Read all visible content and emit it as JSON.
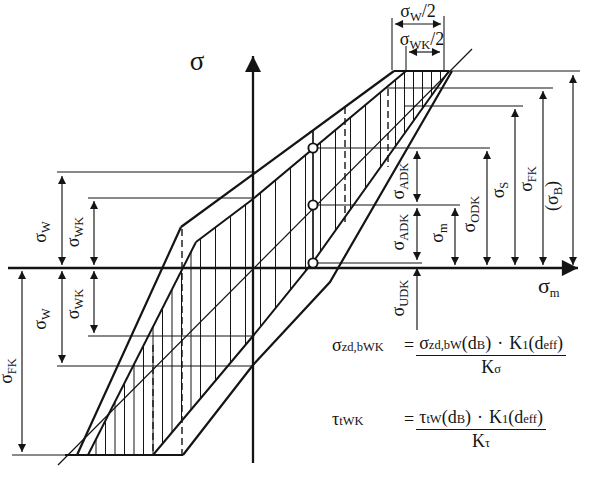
{
  "axes": {
    "vertical": "σ",
    "horizontal_main": "σ",
    "horizontal_sub": "m"
  },
  "dims": {
    "sw_half": {
      "m": "σ",
      "s": "W",
      "x": "/2"
    },
    "swk_half": {
      "m": "σ",
      "s": "WK",
      "x": "/2"
    },
    "sw_upper": {
      "m": "σ",
      "s": "W"
    },
    "swk_upper": {
      "m": "σ",
      "s": "WK"
    },
    "swk_lower": {
      "m": "σ",
      "s": "WK"
    },
    "sw_lower": {
      "m": "σ",
      "s": "W"
    },
    "sfk_left": {
      "m": "σ",
      "s": "FK"
    },
    "adk_upper": {
      "m": "σ",
      "s": "ADK"
    },
    "adk_lower": {
      "m": "σ",
      "s": "ADK"
    },
    "udk": {
      "m": "σ",
      "s": "UDK"
    },
    "sm": {
      "m": "σ",
      "s": "m"
    },
    "odk": {
      "m": "σ",
      "s": "ODK"
    },
    "ss": {
      "m": "σ",
      "s": "S"
    },
    "sfk_right": {
      "m": "σ",
      "s": "FK"
    },
    "sb": {
      "m": "(σ",
      "s": "B",
      "x": ")"
    }
  },
  "formulas": {
    "f1": {
      "lhs": "σ",
      "lhs_sub": "zd,bWK",
      "eq": "=",
      "n1": "σ",
      "n1_sub": "zd,bW",
      "n2": "(d",
      "n2_sub": "B",
      "n3": ")",
      "dot": "·",
      "n4": "K",
      "n4_sub": "1",
      "n5": "(d",
      "n5_sub": "eff",
      "n6": ")",
      "den": "K",
      "den_sub": "σ"
    },
    "f2": {
      "lhs": "τ",
      "lhs_sub": "tWK",
      "eq": "=",
      "n1": "τ",
      "n1_sub": "tW",
      "n2": "(d",
      "n2_sub": "B",
      "n3": ")",
      "dot": "·",
      "n4": "K",
      "n4_sub": "1",
      "n5": "(d",
      "n5_sub": "eff",
      "n6": ")",
      "den": "K",
      "den_sub": "τ"
    }
  }
}
